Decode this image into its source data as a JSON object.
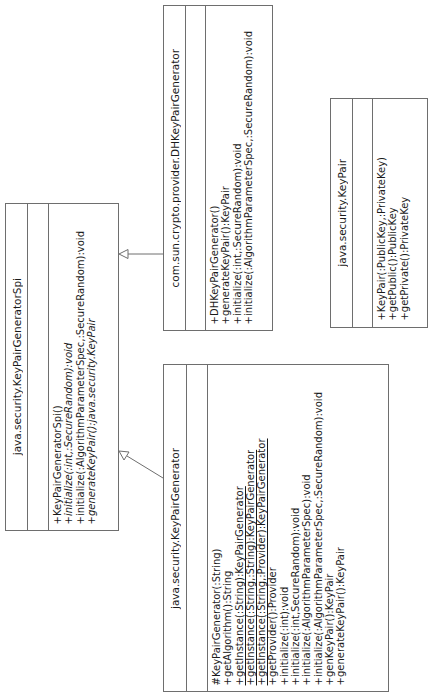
{
  "diagram": {
    "type": "uml-class-diagram",
    "orientation": "rotated-90-ccw",
    "classes": [
      {
        "id": "spi",
        "name": "java.security.KeyPairGeneratorSpi",
        "attributes": [],
        "operations": [
          {
            "text": "+KeyPairGeneratorSpi()",
            "style": "normal"
          },
          {
            "text": "+initialize(:int,:SecureRandom):void",
            "style": "italic"
          },
          {
            "text": "+initialize(:AlgorithmParameterSpec,:SecureRandom):void",
            "style": "normal"
          },
          {
            "text": "+generateKeyPair():java.security.KeyPair",
            "style": "italic"
          }
        ]
      },
      {
        "id": "kpg",
        "name": "java.security.KeyPairGenerator",
        "attributes": [],
        "operations": [
          {
            "text": "#KeyPairGenerator(:String)",
            "style": "normal"
          },
          {
            "text": "+getAlgorithm():String",
            "style": "normal"
          },
          {
            "text": "+getInstance(:String):KeyPairGenerator",
            "style": "static"
          },
          {
            "text": "+getInstance(:String,:String):KeyPairGenerator",
            "style": "static"
          },
          {
            "text": "+getInstance(:String,:Provider):KeyPairGenerator",
            "style": "static"
          },
          {
            "text": "+getProvider():Provider",
            "style": "normal"
          },
          {
            "text": "+initialize(:int):void",
            "style": "normal"
          },
          {
            "text": "+initialize(:int,SecureRandom):void",
            "style": "normal"
          },
          {
            "text": "+initialize(:AlgorithmParameterSpec):void",
            "style": "normal"
          },
          {
            "text": "+initialize(:AlgorithmParameterSpec,:SecureRandom):void",
            "style": "normal"
          },
          {
            "text": "+genKeyPair():KeyPair",
            "style": "normal"
          },
          {
            "text": "+generateKeyPair():KeyPair",
            "style": "normal"
          }
        ]
      },
      {
        "id": "dh",
        "name": "com.sun.crypto.provider.DHKeyPairGenerator",
        "attributes": [],
        "operations": [
          {
            "text": "+DHKeyPairGenerator()",
            "style": "normal"
          },
          {
            "text": "+generateKeyPair():KeyPair",
            "style": "normal"
          },
          {
            "text": "+initialize(:int,:SecureRandom):void",
            "style": "normal"
          },
          {
            "text": "+initialize(:AlgorithmParameterSpec,:SecureRandom):void",
            "style": "normal"
          }
        ]
      },
      {
        "id": "keypair",
        "name": "java.security.KeyPair",
        "attributes": [],
        "operations": [
          {
            "text": "+KeyPair(:PublicKey,:PrivateKey)",
            "style": "normal"
          },
          {
            "text": "+getPublic():PublicKey",
            "style": "normal"
          },
          {
            "text": "+getPrivate():PrivateKey",
            "style": "normal"
          }
        ]
      }
    ],
    "relationships": [
      {
        "type": "generalization",
        "from": "com.sun.crypto.provider.DHKeyPairGenerator",
        "to": "java.security.KeyPairGeneratorSpi"
      },
      {
        "type": "generalization",
        "from": "java.security.KeyPairGenerator",
        "to": "java.security.KeyPairGeneratorSpi"
      }
    ],
    "colors": {
      "line": "#6e6e6e",
      "text": "#1a1a1a",
      "background": "#ffffff"
    }
  }
}
